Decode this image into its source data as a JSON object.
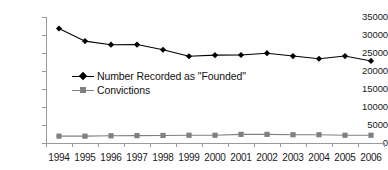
{
  "chart_data": {
    "type": "line",
    "title": "",
    "subtitle": "",
    "xlabel": "",
    "ylabel": "",
    "categories": [
      "1994",
      "1995",
      "1996",
      "1997",
      "1998",
      "1999",
      "2000",
      "2001",
      "2002",
      "2003",
      "2004",
      "2005",
      "2006"
    ],
    "series": [
      {
        "name": "Number Recorded as \"Founded\"",
        "marker": "diamond",
        "color": "#000000",
        "values": [
          31800,
          28300,
          27300,
          27350,
          25900,
          24100,
          24400,
          24450,
          24950,
          24150,
          23400,
          24150,
          22800
        ]
      },
      {
        "name": "Convictions",
        "marker": "square",
        "color": "#808080",
        "values": [
          1900,
          1900,
          2000,
          2050,
          2100,
          2150,
          2150,
          2400,
          2400,
          2300,
          2300,
          2150,
          2150
        ]
      }
    ],
    "ylim": [
      0,
      35000
    ],
    "ytick_values": [
      0,
      5000,
      10000,
      15000,
      20000,
      25000,
      30000,
      35000
    ],
    "ytick_labels": [
      "0",
      "5000",
      "10000",
      "15000",
      "20000",
      "25000",
      "30000",
      "35000"
    ],
    "grid": false,
    "legend_position": "inside-upper-left",
    "annotations": []
  },
  "legend": {
    "items": [
      {
        "label": "Number Recorded as \"Founded\"",
        "marker": "diamond-marker-icon",
        "color": "#000000"
      },
      {
        "label": "Convictions",
        "marker": "square-marker-icon",
        "color": "#808080"
      }
    ]
  },
  "colors": {
    "founded_series": "#000000",
    "convictions_series": "#808080",
    "axis": "#9a9a9a",
    "text": "#1a1a1a",
    "background": "#ffffff"
  }
}
